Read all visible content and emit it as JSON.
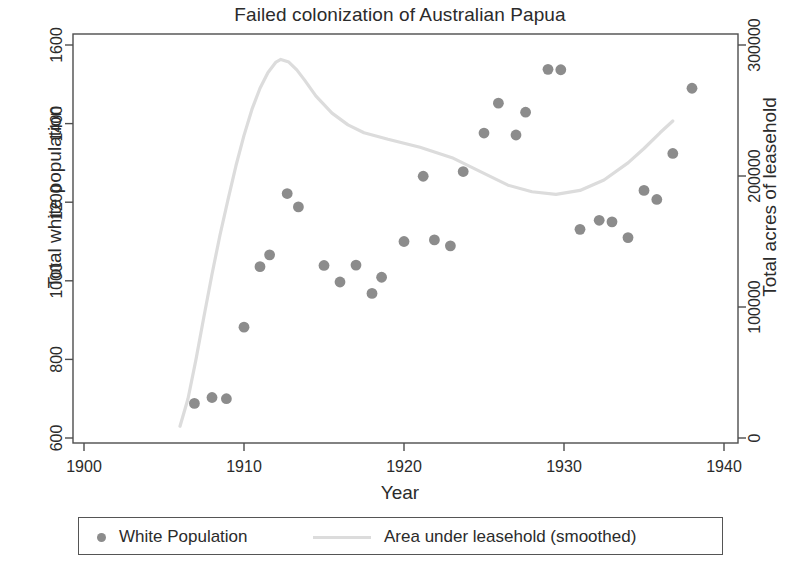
{
  "chart_data": {
    "type": "scatter",
    "title": "Failed colonization of Australian Papua",
    "xlabel": "Year",
    "ylabel": "Total white population",
    "ylabel_right": "Total acres of leasehold",
    "xlim": [
      1900,
      1940
    ],
    "ylim": [
      600,
      1600
    ],
    "ylim_right": [
      0,
      300000
    ],
    "xticks": [
      1900,
      1910,
      1920,
      1930,
      1940
    ],
    "xticklabels": [
      "1900",
      "1910",
      "1920",
      "1930",
      "1940"
    ],
    "yticks": [
      600,
      800,
      1000,
      1200,
      1400,
      1600
    ],
    "yticklabels": [
      "600",
      "800",
      "1000",
      "1200",
      "1400",
      "1600"
    ],
    "yticks_right": [
      0,
      100000,
      200000,
      300000
    ],
    "yticklabels_right": [
      "0",
      "100000",
      "200000",
      "300000"
    ],
    "grid": false,
    "legend_position": "below",
    "colors": {
      "points": "#8c8c8c",
      "line": "#dcdcdc",
      "axis": "#4d4d4d",
      "text": "#2b2b2b"
    },
    "series": [
      {
        "name": "White Population",
        "type": "scatter",
        "axis": "left",
        "marker": "circle",
        "color": "#8c8c8c",
        "points": [
          {
            "x": 1906.9,
            "y": 688
          },
          {
            "x": 1908.0,
            "y": 703
          },
          {
            "x": 1908.9,
            "y": 700
          },
          {
            "x": 1910.0,
            "y": 882
          },
          {
            "x": 1911.0,
            "y": 1036
          },
          {
            "x": 1911.6,
            "y": 1066
          },
          {
            "x": 1912.7,
            "y": 1222
          },
          {
            "x": 1913.4,
            "y": 1188
          },
          {
            "x": 1915.0,
            "y": 1039
          },
          {
            "x": 1916.0,
            "y": 997
          },
          {
            "x": 1917.0,
            "y": 1040
          },
          {
            "x": 1918.0,
            "y": 968
          },
          {
            "x": 1918.6,
            "y": 1009
          },
          {
            "x": 1920.0,
            "y": 1100
          },
          {
            "x": 1921.9,
            "y": 1104
          },
          {
            "x": 1922.9,
            "y": 1089
          },
          {
            "x": 1921.2,
            "y": 1266
          },
          {
            "x": 1923.7,
            "y": 1278
          },
          {
            "x": 1925.0,
            "y": 1376
          },
          {
            "x": 1925.9,
            "y": 1452
          },
          {
            "x": 1927.0,
            "y": 1371
          },
          {
            "x": 1927.6,
            "y": 1429
          },
          {
            "x": 1929.0,
            "y": 1538
          },
          {
            "x": 1929.8,
            "y": 1537
          },
          {
            "x": 1931.0,
            "y": 1131
          },
          {
            "x": 1932.2,
            "y": 1154
          },
          {
            "x": 1933.0,
            "y": 1150
          },
          {
            "x": 1934.0,
            "y": 1110
          },
          {
            "x": 1935.0,
            "y": 1230
          },
          {
            "x": 1935.8,
            "y": 1207
          },
          {
            "x": 1936.8,
            "y": 1324
          },
          {
            "x": 1938.0,
            "y": 1490
          }
        ]
      },
      {
        "name": "Area under leasehold (smoothed)",
        "type": "line",
        "axis": "right",
        "color": "#dcdcdc",
        "points": [
          {
            "x": 1906.0,
            "y": 9000
          },
          {
            "x": 1906.5,
            "y": 30000
          },
          {
            "x": 1907.0,
            "y": 60000
          },
          {
            "x": 1907.5,
            "y": 93000
          },
          {
            "x": 1908.0,
            "y": 125000
          },
          {
            "x": 1908.5,
            "y": 155000
          },
          {
            "x": 1909.0,
            "y": 182000
          },
          {
            "x": 1909.5,
            "y": 208000
          },
          {
            "x": 1910.0,
            "y": 231000
          },
          {
            "x": 1910.5,
            "y": 251000
          },
          {
            "x": 1911.0,
            "y": 267000
          },
          {
            "x": 1911.5,
            "y": 279000
          },
          {
            "x": 1912.0,
            "y": 287000
          },
          {
            "x": 1912.3,
            "y": 289000
          },
          {
            "x": 1912.8,
            "y": 287000
          },
          {
            "x": 1913.3,
            "y": 281000
          },
          {
            "x": 1913.8,
            "y": 273000
          },
          {
            "x": 1914.5,
            "y": 261000
          },
          {
            "x": 1915.5,
            "y": 248000
          },
          {
            "x": 1916.5,
            "y": 239000
          },
          {
            "x": 1917.5,
            "y": 233000
          },
          {
            "x": 1919.0,
            "y": 228000
          },
          {
            "x": 1921.0,
            "y": 222000
          },
          {
            "x": 1923.0,
            "y": 214000
          },
          {
            "x": 1925.0,
            "y": 202000
          },
          {
            "x": 1926.5,
            "y": 193000
          },
          {
            "x": 1928.0,
            "y": 188000
          },
          {
            "x": 1929.5,
            "y": 186000
          },
          {
            "x": 1931.0,
            "y": 189000
          },
          {
            "x": 1932.5,
            "y": 197000
          },
          {
            "x": 1934.0,
            "y": 210000
          },
          {
            "x": 1935.0,
            "y": 221000
          },
          {
            "x": 1936.0,
            "y": 233000
          },
          {
            "x": 1936.8,
            "y": 242000
          }
        ]
      }
    ]
  },
  "legend": {
    "items": [
      {
        "label": "White Population",
        "marker": "dot"
      },
      {
        "label": "Area under leasehold (smoothed)",
        "marker": "line"
      }
    ]
  }
}
